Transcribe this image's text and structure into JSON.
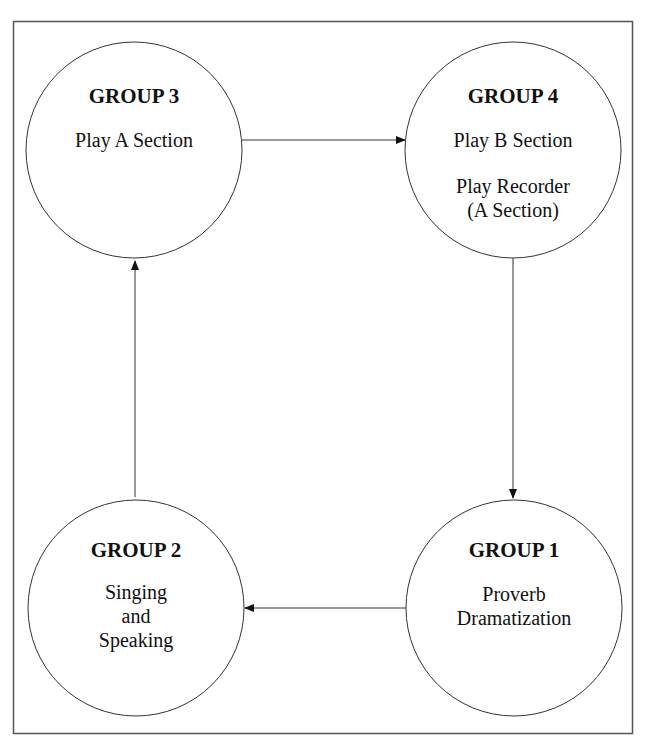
{
  "diagram": {
    "type": "cycle",
    "nodes": [
      {
        "id": "group3",
        "title": "GROUP 3",
        "lines": [
          "Play A Section"
        ]
      },
      {
        "id": "group4",
        "title": "GROUP 4",
        "lines": [
          "Play B Section",
          "Play Recorder",
          "(A Section)"
        ]
      },
      {
        "id": "group1",
        "title": "GROUP 1",
        "lines": [
          "Proverb",
          "Dramatization"
        ]
      },
      {
        "id": "group2",
        "title": "GROUP 2",
        "lines": [
          "Singing",
          "and",
          "Speaking"
        ]
      }
    ],
    "edges": [
      {
        "from": "group3",
        "to": "group4"
      },
      {
        "from": "group4",
        "to": "group1"
      },
      {
        "from": "group1",
        "to": "group2"
      },
      {
        "from": "group2",
        "to": "group3"
      }
    ]
  },
  "colors": {
    "stroke": "#333333",
    "background": "#ffffff"
  }
}
